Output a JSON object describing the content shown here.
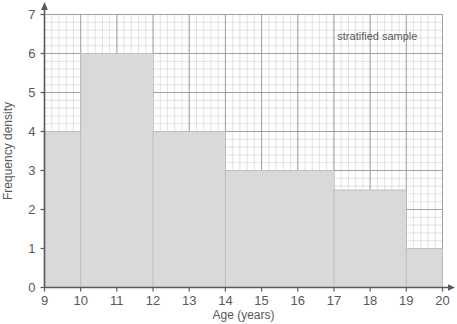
{
  "chart_data": {
    "type": "bar",
    "title": "",
    "subtitle": "",
    "xlabel": "Age (years)",
    "ylabel": "Frequency density",
    "xlim": [
      9,
      20
    ],
    "ylim": [
      0,
      7
    ],
    "grid": true,
    "minor_grid": true,
    "minor_grid_step_x": 0.2,
    "minor_grid_step_y": 0.2,
    "legend": null,
    "legend_position": "none",
    "annotations": [
      {
        "text": "stratified sample",
        "x": 18.2,
        "y": 6.35
      }
    ],
    "bin_edges": [
      9,
      10,
      12,
      14,
      17,
      19,
      20
    ],
    "categories": [
      "9-10",
      "10-12",
      "12-14",
      "14-17",
      "17-19",
      "19-20"
    ],
    "values": [
      4,
      6,
      4,
      3,
      2.5,
      1
    ],
    "bars": [
      {
        "label": "9-10",
        "x0": 9,
        "x1": 10,
        "height": 4,
        "frequency": 4
      },
      {
        "label": "10-12",
        "x0": 10,
        "x1": 12,
        "height": 6,
        "frequency": 12
      },
      {
        "label": "12-14",
        "x0": 12,
        "x1": 14,
        "height": 4,
        "frequency": 8
      },
      {
        "label": "14-17",
        "x0": 14,
        "x1": 17,
        "height": 3,
        "frequency": 9
      },
      {
        "label": "17-19",
        "x0": 17,
        "x1": 19,
        "height": 2.5,
        "frequency": 5
      },
      {
        "label": "19-20",
        "x0": 19,
        "x1": 20,
        "height": 1,
        "frequency": 1
      }
    ],
    "x_ticks": [
      {
        "value": 9,
        "label": "9"
      },
      {
        "value": 10,
        "label": "10"
      },
      {
        "value": 11,
        "label": "11"
      },
      {
        "value": 12,
        "label": "12"
      },
      {
        "value": 13,
        "label": "13"
      },
      {
        "value": 14,
        "label": "14"
      },
      {
        "value": 15,
        "label": "15"
      },
      {
        "value": 16,
        "label": "16"
      },
      {
        "value": 17,
        "label": "17"
      },
      {
        "value": 18,
        "label": "18"
      },
      {
        "value": 19,
        "label": "19"
      },
      {
        "value": 20,
        "label": "20"
      }
    ],
    "y_ticks": [
      {
        "value": 0,
        "label": "0"
      },
      {
        "value": 1,
        "label": "1"
      },
      {
        "value": 2,
        "label": "2"
      },
      {
        "value": 3,
        "label": "3"
      },
      {
        "value": 4,
        "label": "4"
      },
      {
        "value": 5,
        "label": "5"
      },
      {
        "value": 6,
        "label": "6"
      },
      {
        "value": 7,
        "label": "7"
      }
    ],
    "colors": {
      "bar_fill": "#d9d9d9",
      "bar_stroke": "#bfbfbf",
      "major_grid": "#9a9a9a",
      "minor_grid": "#c9c9c9",
      "axis": "#58595b",
      "text": "#58595b",
      "background": "#ffffff"
    }
  }
}
